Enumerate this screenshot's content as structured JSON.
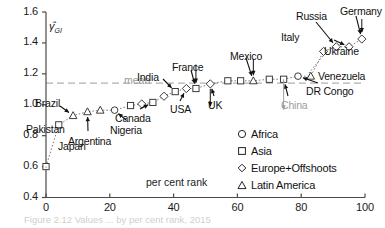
{
  "figure": {
    "caption": "Figure 2.12  Values ... by per cent rank, 2015",
    "mean_label": "mean"
  },
  "chart_data": {
    "type": "scatter",
    "title": "",
    "xlabel": "per cent rank",
    "ylabel": "γ̂",
    "ylabel_sub": "GI",
    "xlim": [
      0,
      100
    ],
    "ylim": [
      0.4,
      1.6
    ],
    "xticks": [
      0,
      20,
      40,
      60,
      80,
      100
    ],
    "yticks": [
      "0.4",
      "0.6",
      "0.8",
      "1.0",
      "1.2",
      "1.4",
      "1.6"
    ],
    "grid": false,
    "mean_value": 1.14,
    "legend_position": "inside-lower-right",
    "series": [
      {
        "name": "Africa",
        "marker": "circle"
      },
      {
        "name": "Asia",
        "marker": "square"
      },
      {
        "name": "Europe+Offshoots",
        "marker": "diamond"
      },
      {
        "name": "Latin America",
        "marker": "triangle"
      }
    ],
    "points": [
      {
        "x": 0.0,
        "y": 0.6,
        "group": "Asia",
        "label": "Japan"
      },
      {
        "x": 4.0,
        "y": 0.87,
        "group": "Asia",
        "label": "Pakistan"
      },
      {
        "x": 8.5,
        "y": 0.93,
        "group": "Latin America",
        "label": "Brazil"
      },
      {
        "x": 13.0,
        "y": 0.955,
        "group": "Latin America",
        "label": "Argentina"
      },
      {
        "x": 17.0,
        "y": 0.965,
        "group": "Latin America",
        "label": ""
      },
      {
        "x": 21.5,
        "y": 0.965,
        "group": "Africa",
        "label": "Nigeria"
      },
      {
        "x": 26.5,
        "y": 0.995,
        "group": "Asia",
        "label": ""
      },
      {
        "x": 30.0,
        "y": 1.005,
        "group": "Europe+Offshoots",
        "label": ""
      },
      {
        "x": 33.5,
        "y": 1.015,
        "group": "Asia",
        "label": "Canada"
      },
      {
        "x": 37.0,
        "y": 1.055,
        "group": "Europe+Offshoots",
        "label": ""
      },
      {
        "x": 40.5,
        "y": 1.085,
        "group": "Asia",
        "label": "India"
      },
      {
        "x": 44.0,
        "y": 1.105,
        "group": "Europe+Offshoots",
        "label": "USA"
      },
      {
        "x": 47.0,
        "y": 1.105,
        "group": "Asia",
        "label": "France"
      },
      {
        "x": 51.5,
        "y": 1.135,
        "group": "Europe+Offshoots",
        "label": "UK"
      },
      {
        "x": 57.0,
        "y": 1.155,
        "group": "Asia",
        "label": ""
      },
      {
        "x": 61.0,
        "y": 1.155,
        "group": "Asia",
        "label": ""
      },
      {
        "x": 65.0,
        "y": 1.155,
        "group": "Latin America",
        "label": "Mexico"
      },
      {
        "x": 70.0,
        "y": 1.165,
        "group": "Asia",
        "label": ""
      },
      {
        "x": 74.5,
        "y": 1.165,
        "group": "Asia",
        "label": "China"
      },
      {
        "x": 79.0,
        "y": 1.185,
        "group": "Africa",
        "label": "DR Congo"
      },
      {
        "x": 83.0,
        "y": 1.185,
        "group": "Latin America",
        "label": "Venezuela"
      },
      {
        "x": 87.0,
        "y": 1.345,
        "group": "Europe+Offshoots",
        "label": "Italy"
      },
      {
        "x": 91.0,
        "y": 1.375,
        "group": "Europe+Offshoots",
        "label": "Russia"
      },
      {
        "x": 95.0,
        "y": 1.375,
        "group": "Europe+Offshoots",
        "label": "Ukraine"
      },
      {
        "x": 99.0,
        "y": 1.425,
        "group": "Europe+Offshoots",
        "label": "Germany"
      }
    ],
    "annotations": [
      {
        "label": "Japan",
        "grey": false
      },
      {
        "label": "Pakistan",
        "grey": false
      },
      {
        "label": "Brazil",
        "grey": false
      },
      {
        "label": "Argentina",
        "grey": false
      },
      {
        "label": "Nigeria",
        "grey": false
      },
      {
        "label": "Canada",
        "grey": false
      },
      {
        "label": "USA",
        "grey": false
      },
      {
        "label": "India",
        "grey": false
      },
      {
        "label": "France",
        "grey": false
      },
      {
        "label": "UK",
        "grey": false
      },
      {
        "label": "Mexico",
        "grey": false
      },
      {
        "label": "China",
        "grey": true
      },
      {
        "label": "DR Congo",
        "grey": false
      },
      {
        "label": "Venezuela",
        "grey": false
      },
      {
        "label": "Italy",
        "grey": false
      },
      {
        "label": "Russia",
        "grey": false
      },
      {
        "label": "Ukraine",
        "grey": false
      },
      {
        "label": "Germany",
        "grey": false
      }
    ]
  }
}
